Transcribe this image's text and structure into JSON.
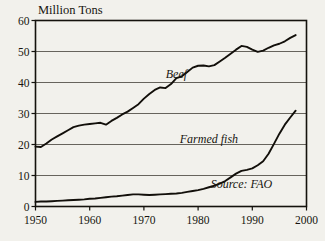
{
  "chart_data": {
    "type": "line",
    "title": "",
    "ylabel": "Million Tons",
    "xlabel": "",
    "xlim": [
      1950,
      2000
    ],
    "ylim": [
      0,
      60
    ],
    "grid": true,
    "legend": "inline-labels",
    "yticks": [
      0,
      10,
      20,
      30,
      40,
      50,
      60
    ],
    "ytick_labels": [
      "0",
      "10",
      "20",
      "30",
      "40",
      "50",
      "60"
    ],
    "xticks": [
      1950,
      1960,
      1970,
      1980,
      1990,
      2000
    ],
    "xtick_labels": [
      "1950",
      "1960",
      "1970",
      "1980",
      "1990",
      "2000"
    ],
    "annotations": [
      {
        "text": "Beef",
        "x": 1976,
        "y": 41.5
      },
      {
        "text": "Farmed fish",
        "x": 1982,
        "y": 20.5
      },
      {
        "text": "Source: FAO",
        "x": 1988,
        "y": 6.0
      }
    ],
    "series": [
      {
        "name": "Beef",
        "x": [
          1950,
          1951,
          1952,
          1953,
          1954,
          1955,
          1956,
          1957,
          1958,
          1959,
          1960,
          1961,
          1962,
          1963,
          1964,
          1965,
          1966,
          1967,
          1968,
          1969,
          1970,
          1971,
          1972,
          1973,
          1974,
          1975,
          1976,
          1977,
          1978,
          1979,
          1980,
          1981,
          1982,
          1983,
          1984,
          1985,
          1986,
          1987,
          1988,
          1989,
          1990,
          1991,
          1992,
          1993,
          1994,
          1995,
          1996,
          1997,
          1998
        ],
        "values": [
          19.3,
          19.2,
          20.3,
          21.6,
          22.6,
          23.6,
          24.6,
          25.6,
          26.1,
          26.4,
          26.6,
          26.8,
          27.0,
          26.4,
          27.6,
          28.6,
          29.7,
          30.6,
          31.8,
          33.0,
          34.8,
          36.3,
          37.6,
          38.4,
          38.2,
          39.5,
          41.4,
          42.0,
          43.4,
          44.8,
          45.4,
          45.5,
          45.2,
          45.6,
          46.8,
          48.0,
          49.3,
          50.6,
          51.8,
          51.5,
          50.6,
          49.9,
          50.3,
          51.2,
          52.0,
          52.5,
          53.3,
          54.4,
          55.3
        ]
      },
      {
        "name": "Farmed fish",
        "x": [
          1950,
          1951,
          1952,
          1953,
          1954,
          1955,
          1956,
          1957,
          1958,
          1959,
          1960,
          1961,
          1962,
          1963,
          1964,
          1965,
          1966,
          1967,
          1968,
          1969,
          1970,
          1971,
          1972,
          1973,
          1974,
          1975,
          1976,
          1977,
          1978,
          1979,
          1980,
          1981,
          1982,
          1983,
          1984,
          1985,
          1986,
          1987,
          1988,
          1989,
          1990,
          1991,
          1992,
          1993,
          1994,
          1995,
          1996,
          1997,
          1998
        ],
        "values": [
          1.5,
          1.6,
          1.6,
          1.7,
          1.8,
          1.9,
          2.0,
          2.1,
          2.2,
          2.3,
          2.5,
          2.6,
          2.8,
          3.0,
          3.2,
          3.3,
          3.5,
          3.7,
          3.9,
          3.9,
          3.8,
          3.7,
          3.8,
          3.9,
          4.0,
          4.1,
          4.2,
          4.4,
          4.7,
          5.0,
          5.3,
          5.7,
          6.2,
          6.7,
          7.4,
          8.2,
          9.4,
          10.6,
          11.5,
          11.8,
          12.3,
          13.3,
          14.6,
          17.0,
          20.2,
          23.5,
          26.4,
          28.7,
          30.9
        ]
      }
    ]
  }
}
